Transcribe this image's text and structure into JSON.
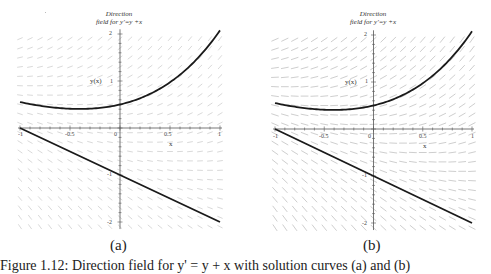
{
  "chart_data": [
    {
      "type": "line",
      "panel_label": "(a)",
      "title": "Direction field for y'=y +x",
      "title_lines": [
        "Direction",
        "field for y'=y +x"
      ],
      "xlabel": "x",
      "ylabel": "y(x)",
      "xlim": [
        -1,
        1
      ],
      "ylim": [
        -2.2,
        2.1
      ],
      "x_ticks": [
        "-1",
        "-0.5",
        "0",
        "0.5",
        "1"
      ],
      "y_ticks": [
        "2",
        "1",
        "-1",
        "-2"
      ],
      "grid": false,
      "direction_field": "y' = y + x",
      "series": [
        {
          "name": "y = 1.5e^x - x - 1",
          "x": [
            -1,
            -0.75,
            -0.5,
            -0.25,
            0,
            0.25,
            0.5,
            0.75,
            1
          ],
          "values": [
            0.55,
            0.46,
            0.41,
            0.42,
            0.5,
            0.68,
            0.97,
            1.43,
            2.08
          ]
        },
        {
          "name": "y = -x - 1",
          "x": [
            -1,
            -0.5,
            0,
            0.5,
            1
          ],
          "values": [
            0,
            -0.5,
            -1,
            -1.5,
            -2
          ]
        }
      ]
    },
    {
      "type": "line",
      "panel_label": "(b)",
      "title": "Direction field for y'=y +x",
      "title_lines": [
        "Direction",
        "field for y'=y +x"
      ],
      "xlabel": "x",
      "ylabel": "y(x)",
      "xlim": [
        -1,
        1
      ],
      "ylim": [
        -2.2,
        2.1
      ],
      "x_ticks": [
        "-1",
        "-0.5",
        "0",
        "0.5",
        "1"
      ],
      "y_ticks": [
        "2",
        "1",
        "-1",
        "-2"
      ],
      "grid": false,
      "direction_field": "y' = y + x",
      "series": [
        {
          "name": "y = 1.5e^x - x - 1",
          "x": [
            -1,
            -0.75,
            -0.5,
            -0.25,
            0,
            0.25,
            0.5,
            0.75,
            1
          ],
          "values": [
            0.55,
            0.46,
            0.41,
            0.42,
            0.5,
            0.68,
            0.97,
            1.43,
            2.08
          ]
        },
        {
          "name": "y = -x - 1",
          "x": [
            -1,
            -0.5,
            0,
            0.5,
            1
          ],
          "values": [
            0,
            -0.5,
            -1,
            -1.5,
            -2
          ]
        }
      ]
    }
  ],
  "panels": [
    {
      "label": "(a)",
      "title1": "Direction",
      "title2": "field for y'=y +x",
      "ylabel": "y(x)",
      "xlabel": "x",
      "xticks": [
        "-1",
        "-0.5",
        "0",
        "0.5",
        "1"
      ],
      "yticks": [
        "2",
        "1",
        "-1",
        "-2"
      ]
    },
    {
      "label": "(b)",
      "title1": "Direction",
      "title2": "field for y'=y +x",
      "ylabel": "y(x)",
      "xlabel": "x",
      "xticks": [
        "-1",
        "-0.5",
        "0",
        "0.5",
        "1"
      ],
      "yticks": [
        "2",
        "1",
        "-1",
        "-2"
      ]
    }
  ],
  "caption": "Figure 1.12: Direction field for y' = y + x with solution curves (a) and (b)",
  "colors": {
    "curve": "#1a1a1a",
    "axis": "#555555",
    "field": "#c8c8c8"
  }
}
